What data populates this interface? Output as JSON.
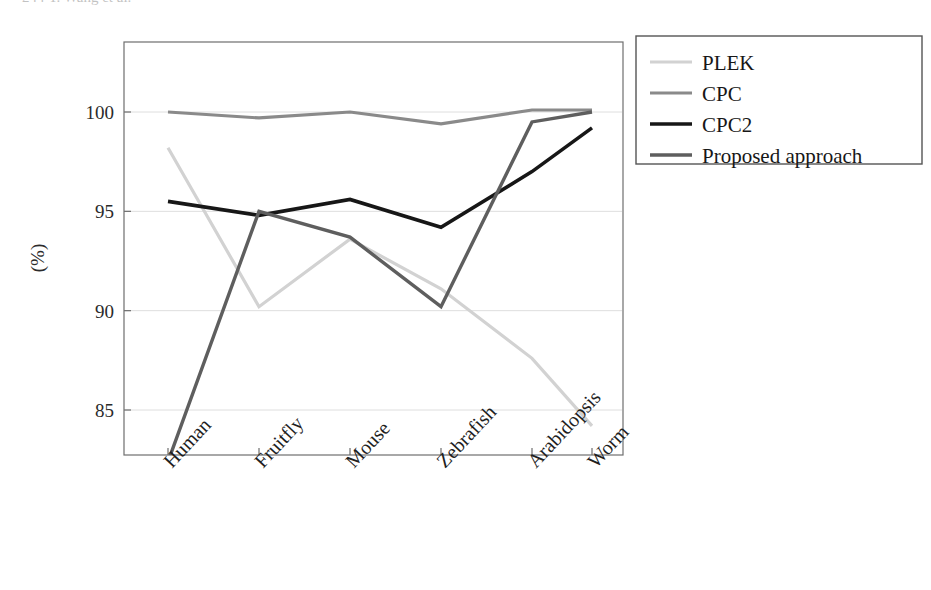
{
  "chart_data": {
    "type": "line",
    "title": "",
    "xlabel": "",
    "ylabel": "(%)",
    "categories": [
      "Human",
      "Fruitfly",
      "Mouse",
      "Zebrafish",
      "Arabidopsis",
      "Worm"
    ],
    "yticks": [
      85,
      90,
      95,
      100
    ],
    "ytick_labels": [
      "85",
      "90",
      "95",
      "100"
    ],
    "ylim": [
      82.3,
      101.5
    ],
    "grid": true,
    "legend_position": "right-top",
    "series": [
      {
        "name": "PLEK",
        "color": "#d2d2d2",
        "width": 3.2,
        "values": [
          98.2,
          90.2,
          93.6,
          91.1,
          87.6,
          84.2
        ]
      },
      {
        "name": "CPC",
        "color": "#8a8a8a",
        "width": 3.2,
        "values": [
          100.0,
          99.7,
          100.0,
          99.4,
          100.1,
          100.1
        ]
      },
      {
        "name": "CPC2",
        "color": "#171717",
        "width": 3.6,
        "values": [
          95.5,
          94.8,
          95.6,
          94.2,
          97.0,
          99.2
        ]
      },
      {
        "name": "Proposed approach",
        "color": "#5e5e5e",
        "width": 3.4,
        "values": [
          82.4,
          95.0,
          93.7,
          90.2,
          99.5,
          100.0
        ]
      }
    ]
  },
  "legend": {
    "entries": [
      "PLEK",
      "CPC",
      "CPC2",
      "Proposed approach"
    ]
  },
  "axis": {
    "y_title": "(%)",
    "y_tick_labels": [
      "100",
      "95",
      "90",
      "85"
    ],
    "x_tick_labels": [
      "Human",
      "Fruitfly",
      "Mouse",
      "Zebrafish",
      "Arabidopsis",
      "Worm"
    ]
  },
  "page_header": {
    "cropped_text": "244      Y. Wang et al."
  }
}
